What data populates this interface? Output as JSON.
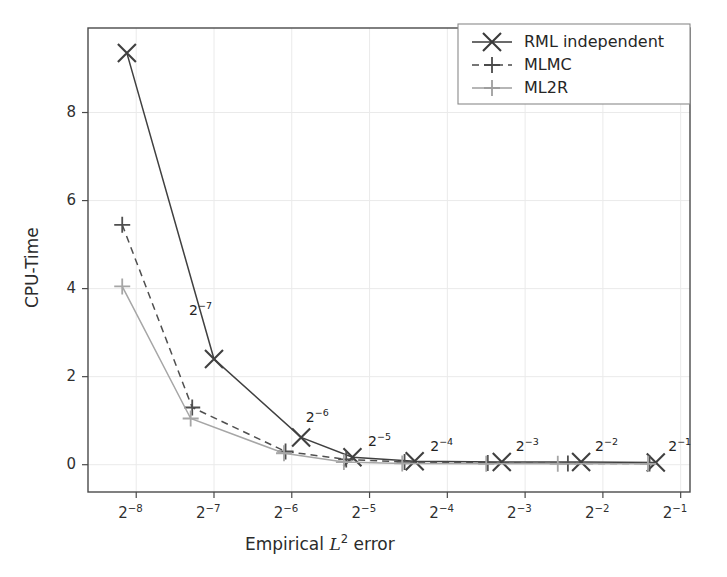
{
  "chart_data": {
    "type": "line",
    "title": "",
    "xlabel": "Empirical L^2 error",
    "ylabel": "CPU-Time",
    "xlabel_parts": {
      "pre": "Empirical ",
      "var": "L",
      "sup": "2",
      "post": " error"
    },
    "x_tick_labels": [
      "2⁻⁸",
      "2⁻⁷",
      "2⁻⁶",
      "2⁻⁵",
      "2⁻⁴",
      "2⁻³",
      "2⁻²",
      "2⁻¹"
    ],
    "x_tick_bases": [
      "2",
      "2",
      "2",
      "2",
      "2",
      "2",
      "2",
      "2"
    ],
    "x_tick_exponents": [
      "-8",
      "-7",
      "-6",
      "-5",
      "-4",
      "-3",
      "-2",
      "-1"
    ],
    "x_tick_values": [
      -8,
      -7,
      -6,
      -5,
      -4,
      -3,
      -2,
      -1
    ],
    "y_tick_labels": [
      "0",
      "2",
      "4",
      "6",
      "8"
    ],
    "y_tick_values": [
      0,
      2,
      4,
      6,
      8
    ],
    "xlim": [
      -8.62,
      -0.88
    ],
    "ylim": [
      -0.62,
      9.92
    ],
    "grid": true,
    "grid_color": "#eaeaea",
    "legend_position": "upper right",
    "series": [
      {
        "name": "RML independent",
        "marker": "x",
        "linestyle": "solid",
        "color": "#404040",
        "x": [
          -8.12,
          -7.0,
          -5.88,
          -5.22,
          -4.42,
          -3.3,
          -2.28,
          -1.32
        ],
        "y": [
          9.35,
          2.4,
          0.62,
          0.17,
          0.08,
          0.06,
          0.06,
          0.05
        ]
      },
      {
        "name": "MLMC",
        "marker": "+",
        "linestyle": "dashed",
        "color": "#4f4f4f",
        "x": [
          -8.18,
          -7.28,
          -6.08,
          -5.3,
          -4.55,
          -3.48,
          -2.45,
          -1.4
        ],
        "y": [
          5.45,
          1.3,
          0.3,
          0.12,
          0.06,
          0.04,
          0.03,
          0.03
        ]
      },
      {
        "name": "ML2R",
        "marker": "+",
        "linestyle": "solid",
        "color": "#a6a6a6",
        "x": [
          -8.18,
          -7.3,
          -6.1,
          -5.33,
          -4.58,
          -3.5,
          -2.58,
          -1.42
        ],
        "y": [
          4.05,
          1.05,
          0.26,
          0.06,
          0.03,
          0.02,
          0.02,
          0.02
        ]
      }
    ],
    "annotations": [
      {
        "text_base": "2",
        "text_sup": "-7",
        "x": -7.32,
        "y": 3.45
      },
      {
        "text_base": "2",
        "text_sup": "-6",
        "x": -5.82,
        "y": 1.02
      },
      {
        "text_base": "2",
        "text_sup": "-5",
        "x": -5.02,
        "y": 0.47
      },
      {
        "text_base": "2",
        "text_sup": "-4",
        "x": -4.22,
        "y": 0.35
      },
      {
        "text_base": "2",
        "text_sup": "-3",
        "x": -3.12,
        "y": 0.35
      },
      {
        "text_base": "2",
        "text_sup": "-2",
        "x": -2.1,
        "y": 0.35
      },
      {
        "text_base": "2",
        "text_sup": "-1",
        "x": -1.16,
        "y": 0.35
      }
    ]
  },
  "legend": {
    "entries": [
      {
        "label": "RML  independent",
        "marker": "x",
        "linestyle": "solid",
        "color": "#3a3a3a"
      },
      {
        "label": "MLMC",
        "marker": "+",
        "linestyle": "dashed",
        "color": "#4a4a4a"
      },
      {
        "label": "ML2R",
        "marker": "+",
        "linestyle": "solid",
        "color": "#9e9e9e"
      }
    ],
    "border_color": "#8a8a8a"
  },
  "axes": {
    "frame_color": "#4a4a4a",
    "tick_color": "#4a4a4a",
    "background": "#ffffff"
  }
}
